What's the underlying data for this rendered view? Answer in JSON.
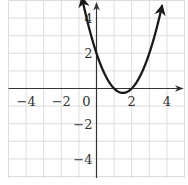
{
  "chart_data": {
    "type": "line",
    "title": "",
    "xlabel": "",
    "ylabel": "",
    "function": "y = x^2 - 3x + 2",
    "xlim": [
      -5,
      5
    ],
    "ylim": [
      -5,
      5
    ],
    "grid": true,
    "x_tick_labels": [
      {
        "value": -4,
        "text": "−4"
      },
      {
        "value": -2,
        "text": "−2"
      },
      {
        "value": 0,
        "text": "0"
      },
      {
        "value": 2,
        "text": "2"
      },
      {
        "value": 4,
        "text": "4"
      }
    ],
    "y_tick_labels": [
      {
        "value": 4,
        "text": "4"
      },
      {
        "value": 2,
        "text": "2"
      },
      {
        "value": -2,
        "text": "−2"
      },
      {
        "value": -4,
        "text": "−4"
      }
    ],
    "series": [
      {
        "name": "parabola",
        "x_range": [
          -0.82,
          3.72
        ],
        "key_points": [
          {
            "x": 0,
            "y": 2
          },
          {
            "x": 1,
            "y": 0
          },
          {
            "x": 1.5,
            "y": -0.25
          },
          {
            "x": 2,
            "y": 0
          },
          {
            "x": 3,
            "y": 2
          }
        ],
        "arrows_at_ends": true
      }
    ]
  },
  "colors": {
    "grid": "#dcdcdc",
    "axis": "#333333",
    "curve": "#1a1a1a",
    "label": "#333333",
    "background": "#ffffff"
  },
  "layout": {
    "origin_px": [
      96.5,
      88.5
    ],
    "unit_px": 17.6
  }
}
